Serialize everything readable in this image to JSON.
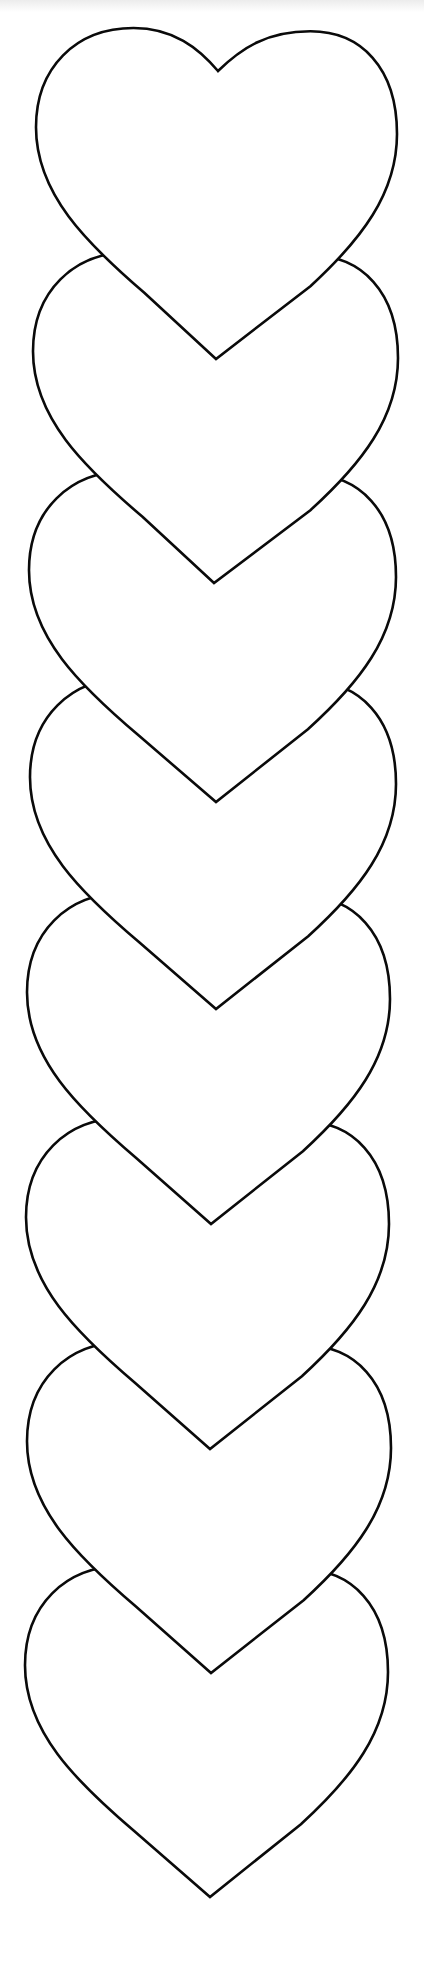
{
  "page": {
    "width": 424,
    "height": 1986,
    "background": "#ffffff",
    "stroke_color": "#0a0a0a",
    "top_band_color": "#ececec"
  },
  "hearts": [
    {
      "x0": 36,
      "x1": 397,
      "top": 28,
      "tip_x": 216,
      "tip_y": 359
    },
    {
      "x0": 33,
      "x1": 398,
      "top": 252,
      "tip_x": 214,
      "tip_y": 583
    },
    {
      "x0": 29,
      "x1": 396,
      "top": 471,
      "tip_x": 216,
      "tip_y": 802
    },
    {
      "x0": 30,
      "x1": 396,
      "top": 678,
      "tip_x": 216,
      "tip_y": 1009
    },
    {
      "x0": 27,
      "x1": 390,
      "top": 893,
      "tip_x": 211,
      "tip_y": 1224
    },
    {
      "x0": 26,
      "x1": 389,
      "top": 1118,
      "tip_x": 210,
      "tip_y": 1449
    },
    {
      "x0": 27,
      "x1": 391,
      "top": 1342,
      "tip_x": 211,
      "tip_y": 1673
    },
    {
      "x0": 25,
      "x1": 388,
      "top": 1566,
      "tip_x": 210,
      "tip_y": 1897
    }
  ]
}
